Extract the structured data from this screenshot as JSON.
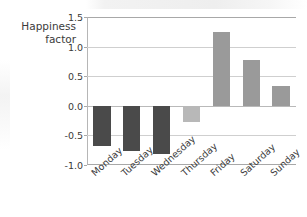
{
  "chart_data": {
    "type": "bar",
    "title": "",
    "xlabel": "",
    "ylabel": "Happiness factor",
    "ylabel_line1": "Happiness",
    "ylabel_line2": "factor",
    "categories": [
      "Monday",
      "Tuesday",
      "Wednesday",
      "Thursday",
      "Friday",
      "Saturday",
      "Sunday"
    ],
    "values": [
      -0.68,
      -0.76,
      -0.82,
      -0.27,
      1.25,
      0.78,
      0.34
    ],
    "bar_colors": [
      "#4a4a4a",
      "#4a4a4a",
      "#4a4a4a",
      "#b8b8b8",
      "#9a9a9a",
      "#9a9a9a",
      "#9a9a9a"
    ],
    "ylim": [
      -1.0,
      1.5
    ],
    "yticks": [
      1.5,
      1.0,
      0.5,
      0.0,
      -0.5,
      -1.0
    ],
    "ytick_labels": [
      "1.5",
      "1.0",
      "0.5",
      "0.0",
      "-0.5",
      "-1.0"
    ],
    "grid": true,
    "grid_axis": "y",
    "legend": "none",
    "xtick_rotation": -42
  },
  "colors": {
    "negative_bar": "#4a4a4a",
    "thursday_bar": "#b8b8b8",
    "positive_bar": "#9a9a9a",
    "gridline": "#cfcfcf",
    "axis": "#a8a8a8",
    "text": "#3b3b3b",
    "background": "#ffffff"
  }
}
